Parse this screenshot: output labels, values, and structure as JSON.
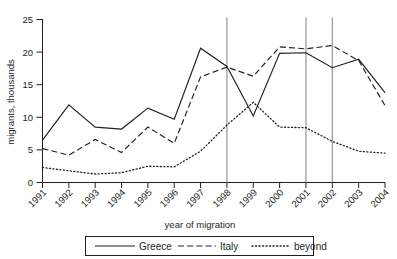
{
  "chart_data": {
    "type": "line",
    "title": "",
    "xlabel": "year of migration",
    "ylabel": "migrants, thousands",
    "categories": [
      "1991",
      "1992",
      "1993",
      "1994",
      "1995",
      "1996",
      "1997",
      "1998",
      "1999",
      "2000",
      "2001",
      "2002",
      "2003",
      "2004"
    ],
    "x": [
      1991,
      1992,
      1993,
      1994,
      1995,
      1996,
      1997,
      1998,
      1999,
      2000,
      2001,
      2002,
      2003,
      2004
    ],
    "xlim": [
      1991,
      2004
    ],
    "ylim": [
      0,
      25
    ],
    "yticks": [
      0,
      5,
      10,
      15,
      20,
      25
    ],
    "ytick_labels": [
      "0",
      "5",
      "10",
      "15",
      "20",
      "25"
    ],
    "grid": false,
    "legend_position": "bottom",
    "annotations": {
      "vertical_reference_lines": [
        1998,
        2001,
        2002
      ]
    },
    "series": [
      {
        "name": "Greece",
        "style": "solid",
        "values": [
          6.5,
          11.9,
          8.5,
          8.2,
          11.4,
          9.7,
          20.6,
          17.8,
          10.2,
          19.8,
          19.9,
          17.6,
          18.9,
          13.8
        ]
      },
      {
        "name": "Italy",
        "style": "dashed",
        "values": [
          5.2,
          4.2,
          6.6,
          4.6,
          8.5,
          6.0,
          16.2,
          17.7,
          16.3,
          20.8,
          20.5,
          21.0,
          18.7,
          11.8
        ]
      },
      {
        "name": "beyond",
        "style": "dotted",
        "values": [
          2.3,
          1.8,
          1.3,
          1.5,
          2.5,
          2.4,
          4.8,
          8.8,
          12.3,
          8.5,
          8.4,
          6.3,
          4.8,
          4.5
        ]
      }
    ]
  },
  "legend": {
    "items": [
      {
        "label": "Greece",
        "style": "solid"
      },
      {
        "label": "Italy",
        "style": "dashed"
      },
      {
        "label": "beyond",
        "style": "dotted"
      }
    ]
  }
}
